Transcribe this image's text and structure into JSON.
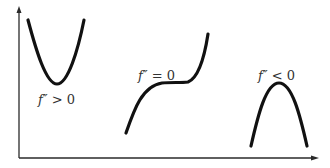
{
  "diagram": {
    "axes": {
      "x_axis": {
        "from": [
          19,
          158
        ],
        "to": [
          318,
          158
        ],
        "arrow": true
      },
      "y_axis": {
        "from": [
          19,
          158
        ],
        "to": [
          19,
          7
        ],
        "arrow": true
      }
    },
    "curves": [
      {
        "id": "convex",
        "shape": "U-shaped parabola (concave up)",
        "label": {
          "fn": "f″",
          "relation": " > 0",
          "text": "f″ > 0"
        }
      },
      {
        "id": "inflection",
        "shape": "cubic with flat inflection",
        "label": {
          "fn": "f″",
          "relation": " = 0",
          "text": "f″ = 0"
        }
      },
      {
        "id": "concave",
        "shape": "inverted parabola (concave down)",
        "label": {
          "fn": "f″",
          "relation": " < 0",
          "text": "f″ < 0"
        }
      }
    ],
    "colors": {
      "curve": "#111111",
      "axis": "#2a2a2a",
      "text": "#333333",
      "background": "#ffffff"
    }
  }
}
